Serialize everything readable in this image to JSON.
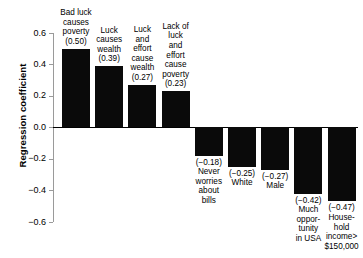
{
  "chart_data": {
    "type": "bar",
    "title": "",
    "subtitle": "",
    "xlabel": "",
    "ylabel": "Regression coefficient",
    "ylim": [
      -0.6,
      0.6
    ],
    "yticks": [
      "0.6",
      "0.4",
      "0.2",
      "0.0",
      "−0.2",
      "−0.4",
      "−0.6"
    ],
    "ytick_values": [
      0.6,
      0.4,
      0.2,
      0.0,
      -0.2,
      -0.4,
      -0.6
    ],
    "grid": false,
    "legend": "none",
    "bar_color": "#0a0a0a",
    "axis_color": "#9a9a9a",
    "zero_line_color": "#000000",
    "categories": [
      "Bad luck causes poverty",
      "Luck causes wealth",
      "Luck and effort cause wealth",
      "Lack of luck and effort cause poverty",
      "Never worries about bills",
      "White",
      "Male",
      "Much opportunity in USA",
      "Household income> $150,000"
    ],
    "values": [
      0.5,
      0.39,
      0.27,
      0.23,
      -0.18,
      -0.25,
      -0.27,
      -0.42,
      -0.47
    ],
    "value_labels": [
      "(0.50)",
      "(0.39)",
      "(0.27)",
      "(0.23)",
      "(−0.18)",
      "(−0.25)",
      "(−0.27)",
      "(−0.42)",
      "(−0.47)"
    ],
    "bars": [
      {
        "label_lines": "Bad luck\ncauses\npoverty\n(0.50)",
        "value": 0.5,
        "value_label": "(0.50)",
        "position": "above"
      },
      {
        "label_lines": "Luck\ncauses\nwealth\n(0.39)",
        "value": 0.39,
        "value_label": "(0.39)",
        "position": "above"
      },
      {
        "label_lines": "Luck\nand\neffort\ncause\nwealth\n(0.27)",
        "value": 0.27,
        "value_label": "(0.27)",
        "position": "above"
      },
      {
        "label_lines": "Lack of\nluck\nand\neffort\ncause\npoverty\n(0.23)",
        "value": 0.23,
        "value_label": "(0.23)",
        "position": "above"
      },
      {
        "label_lines": "(−0.18)\nNever\nworries\nabout\nbills",
        "value": -0.18,
        "value_label": "(−0.18)",
        "position": "below"
      },
      {
        "label_lines": "(−0.25)\nWhite",
        "value": -0.25,
        "value_label": "(−0.25)",
        "position": "below"
      },
      {
        "label_lines": "(−0.27)\nMale",
        "value": -0.27,
        "value_label": "(−0.27)",
        "position": "below"
      },
      {
        "label_lines": "(−0.42)\nMuch\noppor-\ntunity\nin USA",
        "value": -0.42,
        "value_label": "(−0.42)",
        "position": "below"
      },
      {
        "label_lines": "(−0.47)\nHouse-\nhold\nincome>\n$150,000",
        "value": -0.47,
        "value_label": "(−0.47)",
        "position": "below"
      }
    ]
  },
  "axis": {
    "ylabel": "Regression coefficient"
  }
}
